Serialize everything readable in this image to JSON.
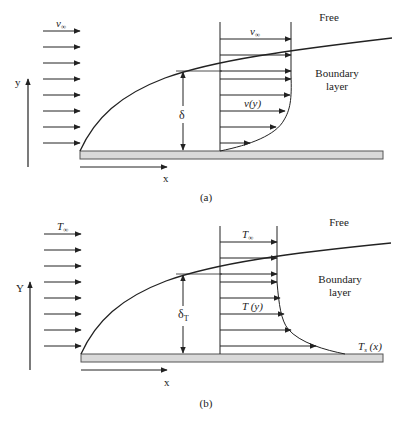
{
  "panels": [
    {
      "id": "a",
      "caption": "(a)",
      "free_label": "Free",
      "bl_label_line1": "Boundary",
      "bl_label_line2": "layer",
      "freestream_label": "v",
      "freestream_sub": "∞",
      "profile_top_label": "v",
      "profile_top_sub": "∞",
      "profile_label": "v(y)",
      "thickness_label": "δ",
      "thickness_sub": "",
      "x_axis_label": "x",
      "y_axis_label": "y",
      "surface_label": "",
      "surface_sub": "",
      "surface_suffix": ""
    },
    {
      "id": "b",
      "caption": "(b)",
      "free_label": "Free",
      "bl_label_line1": "Boundary",
      "bl_label_line2": "layer",
      "freestream_label": "T",
      "freestream_sub": "∞",
      "profile_top_label": "T",
      "profile_top_sub": "∞",
      "profile_label": "T (y)",
      "thickness_label": "δ",
      "thickness_sub": "T",
      "x_axis_label": "x",
      "y_axis_label": "Y",
      "surface_label": "T",
      "surface_sub": "s",
      "surface_suffix": " (x)"
    }
  ],
  "colors": {
    "line": "#222222",
    "plate_fill": "#d9d9d9",
    "plate_stroke": "#555555",
    "background": "#ffffff"
  }
}
